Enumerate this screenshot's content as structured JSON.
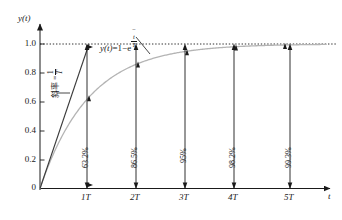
{
  "chart_data": {
    "type": "line",
    "title": "",
    "xlabel": "t",
    "ylabel": "y(t)",
    "equation_label": "y(t) = 1 - e^(-t/T)",
    "slope_label": "斜率 = 1/T",
    "slope_label_prefix": "斜率 =",
    "xlim": [
      0,
      5.9
    ],
    "ylim": [
      0,
      1.12
    ],
    "grid": false,
    "asymptote": 1.0,
    "asymptote_style": "dotted",
    "x_ticks": [
      1,
      2,
      3,
      4,
      5
    ],
    "x_tick_labels": [
      "1T",
      "2T",
      "3T",
      "4T",
      "5T"
    ],
    "y_ticks": [
      0,
      0.2,
      0.4,
      0.6,
      0.8,
      1.0
    ],
    "y_tick_labels": [
      "0",
      "0.2",
      "0.4",
      "0.6",
      "0.8",
      "1.0"
    ],
    "series": [
      {
        "name": "y(t) = 1 - e^(-t/T)",
        "type": "curve",
        "color": "#b4b4b4",
        "x": [
          0,
          0.1,
          0.2,
          0.3,
          0.4,
          0.5,
          0.6,
          0.7,
          0.8,
          0.9,
          1.0,
          1.2,
          1.4,
          1.6,
          1.8,
          2.0,
          2.5,
          3.0,
          3.5,
          4.0,
          4.5,
          5.0,
          5.5
        ],
        "values": [
          0,
          0.095,
          0.181,
          0.259,
          0.33,
          0.393,
          0.451,
          0.503,
          0.551,
          0.593,
          0.632,
          0.699,
          0.753,
          0.798,
          0.835,
          0.865,
          0.918,
          0.95,
          0.97,
          0.982,
          0.989,
          0.993,
          0.996
        ]
      },
      {
        "name": "tangent at origin",
        "type": "line",
        "color": "#3a3a3a",
        "x": [
          0,
          1.0
        ],
        "values": [
          0,
          1.0
        ]
      }
    ],
    "annotations": [
      {
        "x": 1,
        "value": 0.632,
        "label": "63.2%"
      },
      {
        "x": 2,
        "value": 0.865,
        "label": "86.5%"
      },
      {
        "x": 3,
        "value": 0.95,
        "label": "95%"
      },
      {
        "x": 4,
        "value": 0.982,
        "label": "98.2%"
      },
      {
        "x": 5,
        "value": 0.993,
        "label": "99.3%"
      }
    ],
    "colors": {
      "axis": "#1a1a1a",
      "curve": "#b4b4b4",
      "tangent": "#3a3a3a",
      "annotation_arrow": "#1a1a1a",
      "asymptote": "#1a1a1a",
      "background": "#ffffff"
    }
  },
  "axes": {
    "y_label": "y(t)",
    "y_label_y": "y",
    "y_label_t": "(t)",
    "x_label": "t"
  },
  "equation": {
    "lhs": "y(t)",
    "eq": "=1−e",
    "exp_minus": "−",
    "exp_num": "t",
    "exp_den": "T"
  },
  "slope": {
    "text": "斜率 =",
    "num": "1",
    "den": "T"
  },
  "ticks": {
    "y": [
      "1.0",
      "0.8",
      "0.6",
      "0.4",
      "0.2",
      "0"
    ],
    "x": [
      "1T",
      "2T",
      "3T",
      "4T",
      "5T"
    ]
  },
  "percentages": [
    "63.2%",
    "86.5%",
    "95%",
    "98.2%",
    "99.3%"
  ]
}
